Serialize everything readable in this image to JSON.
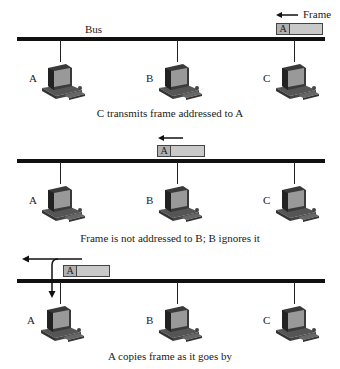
{
  "diagram": {
    "panels": [
      {
        "bus_label": "Bus",
        "frame_label": "Frame",
        "frame_address": "A",
        "stations": [
          "A",
          "B",
          "C"
        ],
        "caption": "C transmits frame addressed to A"
      },
      {
        "frame_address": "A",
        "stations": [
          "A",
          "B",
          "C"
        ],
        "caption": "Frame is not addressed to B; B ignores it"
      },
      {
        "frame_address": "A",
        "stations": [
          "A",
          "B",
          "C"
        ],
        "caption": "A copies frame as it goes by"
      }
    ],
    "colors": {
      "bus": "#111111",
      "frame_fill": "#c9c9c9",
      "frame_address_fill": "#b0b0b0"
    }
  }
}
